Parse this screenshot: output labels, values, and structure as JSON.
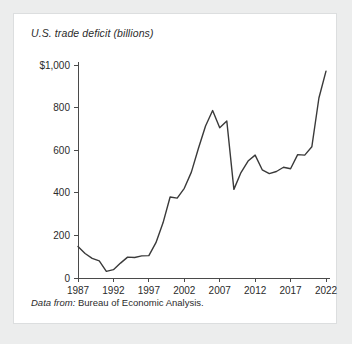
{
  "figure": {
    "title": "U.S. trade deficit (billions)",
    "source_label": "Data from:",
    "source_text": "Bureau of Economic Analysis.",
    "card_background": "#ffffff",
    "page_background": "#eceded",
    "line_color": "#3a3a3a",
    "axis_color": "#4a4a4a"
  },
  "chart_data": {
    "type": "line",
    "title": "U.S. trade deficit (billions)",
    "xlabel": "",
    "ylabel": "",
    "xlim": [
      1987,
      2022
    ],
    "ylim": [
      0,
      1000
    ],
    "grid": false,
    "legend": "none",
    "x_tick_labels": [
      "1987",
      "1992",
      "1997",
      "2002",
      "2007",
      "2012",
      "2017",
      "2022"
    ],
    "x_ticks": [
      1987,
      1992,
      1997,
      2002,
      2007,
      2012,
      2017,
      2022
    ],
    "y_tick_labels": [
      "0",
      "200",
      "400",
      "600",
      "800",
      "$1,000"
    ],
    "y_ticks": [
      0,
      200,
      400,
      600,
      800,
      1000
    ],
    "x": [
      1987,
      1988,
      1989,
      1990,
      1991,
      1992,
      1993,
      1994,
      1995,
      1996,
      1997,
      1998,
      1999,
      2000,
      2001,
      2002,
      2003,
      2004,
      2005,
      2006,
      2007,
      2008,
      2009,
      2010,
      2011,
      2012,
      2013,
      2014,
      2015,
      2016,
      2017,
      2018,
      2019,
      2020,
      2021,
      2022
    ],
    "values": [
      148,
      115,
      92,
      80,
      31,
      39,
      70,
      98,
      96,
      104,
      105,
      166,
      259,
      380,
      375,
      421,
      497,
      609,
      714,
      786,
      705,
      737,
      416,
      495,
      549,
      577,
      508,
      490,
      500,
      520,
      513,
      579,
      577,
      616,
      845,
      971
    ],
    "series": [
      {
        "name": "U.S. trade deficit (billions)",
        "values": [
          148,
          115,
          92,
          80,
          31,
          39,
          70,
          98,
          96,
          104,
          105,
          166,
          259,
          380,
          375,
          421,
          497,
          609,
          714,
          786,
          705,
          737,
          416,
          495,
          549,
          577,
          508,
          490,
          500,
          520,
          513,
          579,
          577,
          616,
          845,
          971
        ]
      }
    ],
    "annotations": []
  }
}
